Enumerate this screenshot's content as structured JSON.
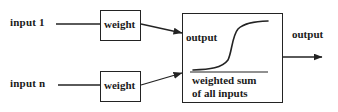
{
  "diagram": {
    "stroke_color": "#232323",
    "text_color": "#1a1a1a",
    "background_color": "#ffffff",
    "inputs": [
      {
        "label": "input 1"
      },
      {
        "label": "input n"
      }
    ],
    "weights": [
      {
        "label": "weight"
      },
      {
        "label": "weight"
      }
    ],
    "neuron": {
      "y_axis_label": "output",
      "x_axis_label_line1": "weighted sum",
      "x_axis_label_line2": "of all inputs",
      "curve_type": "sigmoid"
    },
    "output": {
      "label": "output"
    }
  }
}
